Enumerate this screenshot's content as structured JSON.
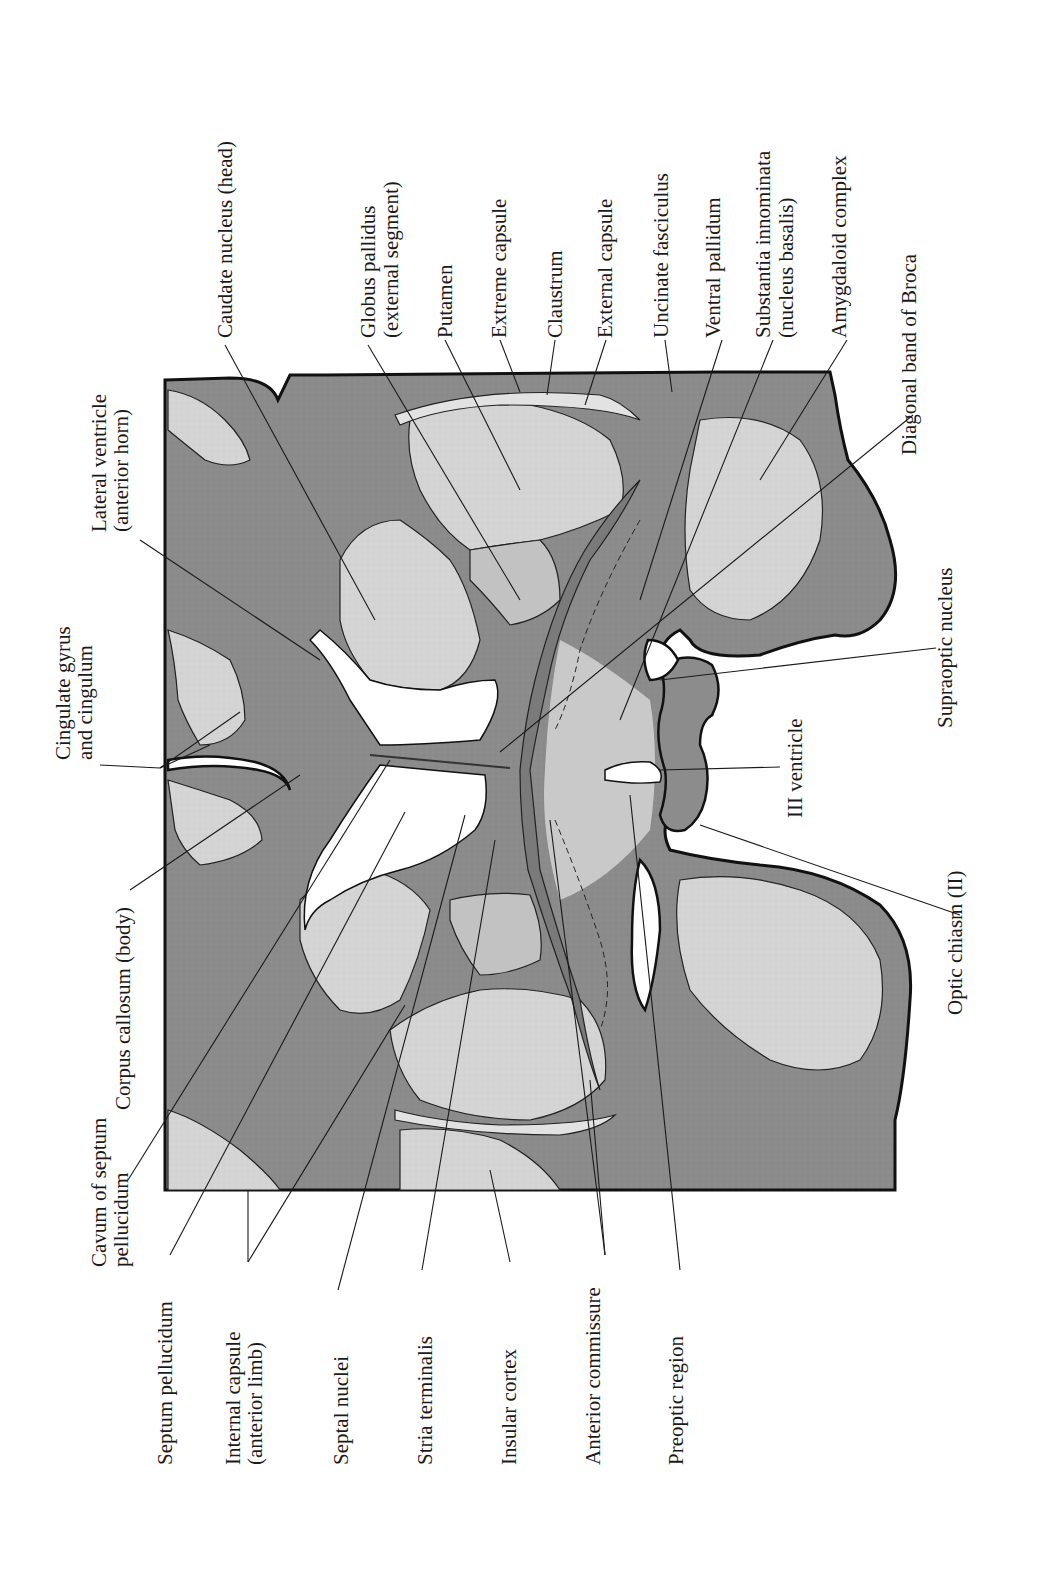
{
  "figure": {
    "colors": {
      "white_matter": "#8a8a8a",
      "gray_matter": "#d2d2d2",
      "ventricle": "#ffffff",
      "outline": "#111111",
      "text": "#1a1a1a"
    }
  },
  "labels": {
    "top": [
      {
        "id": "lateral-ventricle",
        "lines": [
          "Lateral ventricle",
          "(anterior horn)"
        ]
      },
      {
        "id": "cingulate-gyrus",
        "lines": [
          "Cingulate gyrus",
          "and cingulum"
        ]
      },
      {
        "id": "caudate-nucleus",
        "lines": [
          "Caudate nucleus (head)"
        ]
      },
      {
        "id": "globus-pallidus",
        "lines": [
          "Globus pallidus",
          "(external segment)"
        ]
      },
      {
        "id": "putamen",
        "lines": [
          "Putamen"
        ]
      },
      {
        "id": "extreme-capsule",
        "lines": [
          "Extreme capsule"
        ]
      },
      {
        "id": "claustrum",
        "lines": [
          "Claustrum"
        ]
      },
      {
        "id": "external-capsule",
        "lines": [
          "External capsule"
        ]
      },
      {
        "id": "uncinate-fasciculus",
        "lines": [
          "Uncinate fasciculus"
        ]
      },
      {
        "id": "ventral-pallidum",
        "lines": [
          "Ventral pallidum"
        ]
      },
      {
        "id": "substantia-innominata",
        "lines": [
          "Substantia innominata",
          "(nucleus basalis)"
        ]
      },
      {
        "id": "amygdaloid-complex",
        "lines": [
          "Amygdaloid complex"
        ]
      }
    ],
    "right": [
      {
        "id": "diagonal-band",
        "lines": [
          "Diagonal band of Broca"
        ]
      },
      {
        "id": "supraoptic-nucleus",
        "lines": [
          "Supraoptic nucleus"
        ]
      },
      {
        "id": "third-ventricle",
        "lines": [
          "III ventricle"
        ]
      },
      {
        "id": "optic-chiasm",
        "lines": [
          "Optic chiasm (II)"
        ]
      }
    ],
    "left": [
      {
        "id": "corpus-callosum",
        "lines": [
          "Corpus callosum (body)"
        ]
      },
      {
        "id": "cavum-septum",
        "lines": [
          "Cavum of septum",
          "pellucidum"
        ]
      }
    ],
    "bottom": [
      {
        "id": "septum-pellucidum",
        "lines": [
          "Septum pellucidum"
        ]
      },
      {
        "id": "internal-capsule",
        "lines": [
          "Internal capsule",
          "(anterior limb)"
        ]
      },
      {
        "id": "septal-nuclei",
        "lines": [
          "Septal nuclei"
        ]
      },
      {
        "id": "stria-terminalis",
        "lines": [
          "Stria terminalis"
        ]
      },
      {
        "id": "insular-cortex",
        "lines": [
          "Insular cortex"
        ]
      },
      {
        "id": "anterior-commissure",
        "lines": [
          "Anterior commissure"
        ]
      },
      {
        "id": "preoptic-region",
        "lines": [
          "Preoptic region"
        ]
      }
    ]
  }
}
